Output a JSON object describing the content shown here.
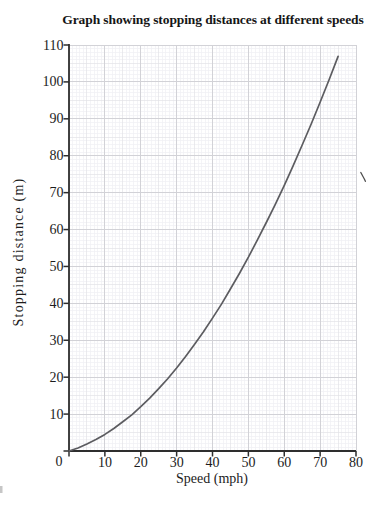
{
  "chart_data": {
    "type": "line",
    "title": "Graph showing stopping distances at different speeds",
    "xlabel": "Speed (mph)",
    "ylabel": "Stopping distance (m)",
    "xlim": [
      0,
      80
    ],
    "ylim": [
      0,
      110
    ],
    "x_ticks": [
      0,
      10,
      20,
      30,
      40,
      50,
      60,
      70,
      80
    ],
    "y_ticks": [
      0,
      10,
      20,
      30,
      40,
      50,
      60,
      70,
      80,
      90,
      100,
      110
    ],
    "origin_label": "0",
    "grid": "graph-paper: minor every 1 unit, medium every 5, major every 10",
    "legend_position": "none",
    "series": [
      {
        "name": "Stopping distance curve",
        "x": [
          0,
          2.5,
          5,
          7.5,
          10,
          12.5,
          15,
          17.5,
          20,
          22.5,
          25,
          27.5,
          30,
          32.5,
          35,
          37.5,
          40,
          42.5,
          45,
          47.5,
          50,
          52.5,
          55,
          57.5,
          60,
          62.5,
          65,
          67.5,
          70,
          72.5,
          75
        ],
        "y": [
          0,
          0.8,
          1.9,
          3.1,
          4.5,
          6.1,
          7.9,
          9.8,
          12,
          14.3,
          16.9,
          19.6,
          22.5,
          25.6,
          28.9,
          32.3,
          36,
          39.8,
          43.9,
          48.1,
          52.5,
          57.1,
          61.9,
          66.8,
          72,
          77.3,
          82.9,
          88.6,
          94.5,
          100.6,
          106.9
        ]
      }
    ],
    "colors": {
      "axis": "#2e2e2e",
      "curve": "#5c5c60",
      "grid_major": "#d2d2d7",
      "grid_mid": "#e2e2e7",
      "grid_minor": "#f0f0f3",
      "text": "#1c1c1c",
      "background": "#ffffff"
    }
  }
}
